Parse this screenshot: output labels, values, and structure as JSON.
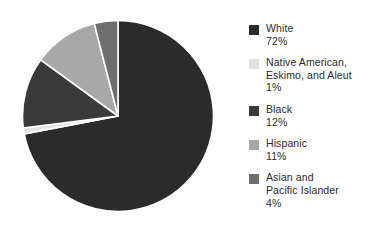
{
  "chart_data": {
    "type": "pie",
    "title": "",
    "subtitle": "",
    "xlabel": "",
    "ylabel": "",
    "grid": false,
    "legend_position": "right",
    "start_angle_deg": 0,
    "direction": "clockwise",
    "categories": [
      "White",
      "Native American, Eskimo, and Aleut",
      "Black",
      "Hispanic",
      "Asian and Pacific Islander"
    ],
    "values": [
      72,
      1,
      12,
      11,
      4
    ],
    "value_labels": [
      "72%",
      "1%",
      "12%",
      "11%",
      "4%"
    ],
    "colors": [
      "#2b2b2b",
      "#e2e2e2",
      "#3a3a3a",
      "#a8a8a8",
      "#6e6e6e"
    ],
    "slice_separator_color": "#ffffff",
    "slice_separator_width": 1.6,
    "slices": [
      {
        "name": "White",
        "value": 72,
        "label": "72%",
        "color": "#2b2b2b"
      },
      {
        "name": "Native American, Eskimo, and Aleut",
        "value": 1,
        "label": "1%",
        "color": "#e2e2e2"
      },
      {
        "name": "Black",
        "value": 12,
        "label": "12%",
        "color": "#3a3a3a"
      },
      {
        "name": "Hispanic",
        "value": 11,
        "label": "11%",
        "color": "#a8a8a8"
      },
      {
        "name": "Asian and Pacific Islander",
        "value": 4,
        "label": "4%",
        "color": "#6e6e6e"
      }
    ]
  },
  "legend": {
    "items": [
      {
        "label": "White",
        "value": "72%",
        "color": "#2b2b2b"
      },
      {
        "label": "Native American,\nEskimo, and Aleut",
        "value": "1%",
        "color": "#e2e2e2"
      },
      {
        "label": "Black",
        "value": "12%",
        "color": "#3a3a3a"
      },
      {
        "label": "Hispanic",
        "value": "11%",
        "color": "#a8a8a8"
      },
      {
        "label": "Asian and\nPacific Islander",
        "value": "4%",
        "color": "#6e6e6e"
      }
    ]
  },
  "canvas": {
    "background": "#ffffff"
  }
}
